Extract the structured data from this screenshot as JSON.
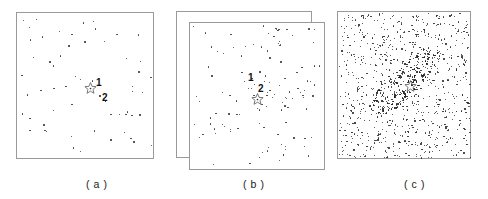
{
  "figure": {
    "background_color": "#ffffff",
    "border_color": "#9a9a9a",
    "dot_color": "#3a3a3a",
    "label_color": "#111111",
    "width": 488,
    "height": 199
  },
  "panels": [
    {
      "id": "a",
      "caption": "( a )",
      "caption_x": 86,
      "caption_y": 178,
      "boxes": [
        {
          "role": "single",
          "x": 16,
          "y": 12,
          "w": 138,
          "h": 147
        }
      ],
      "star": {
        "x": 84,
        "y": 82,
        "size": 13,
        "has_center_dot": true
      },
      "markers": [
        {
          "label": "1",
          "label_x": 96,
          "label_y": 78,
          "dot_x": null,
          "dot_y": null
        },
        {
          "label": "2",
          "label_x": 102,
          "label_y": 93,
          "dot_x": 99,
          "dot_y": 95
        }
      ]
    },
    {
      "id": "b",
      "caption": "( b )",
      "caption_x": 243,
      "caption_y": 178,
      "boxes": [
        {
          "role": "back",
          "x": 176,
          "y": 11,
          "w": 136,
          "h": 147
        },
        {
          "role": "front",
          "x": 189,
          "y": 22,
          "w": 136,
          "h": 148
        }
      ],
      "star": {
        "x": 251,
        "y": 93,
        "size": 13,
        "has_center_dot": true
      },
      "markers": [
        {
          "label": "1",
          "label_x": 248,
          "label_y": 73,
          "dot_x": 259,
          "dot_y": 71
        },
        {
          "label": "2",
          "label_x": 258,
          "label_y": 84,
          "dot_x": null,
          "dot_y": null
        }
      ]
    },
    {
      "id": "c",
      "caption": "( c )",
      "caption_x": 404,
      "caption_y": 178,
      "boxes": [
        {
          "role": "single",
          "x": 337,
          "y": 11,
          "w": 134,
          "h": 148
        }
      ],
      "star": {
        "x": 404,
        "y": 80,
        "size": 13,
        "has_center_dot": false
      },
      "markers": []
    }
  ],
  "chart_data": {
    "type": "scatter",
    "title": "",
    "xlabel": "",
    "ylabel": "",
    "grid": false,
    "legend": null,
    "panel_count": 3,
    "panels": [
      {
        "id": "a",
        "caption": "( a )",
        "description": "Sparse uniform random scatter inside a single square frame with a star marker near the centre labelled 1 and a nearby point labelled 2.",
        "frame_count": 1,
        "point_count": 58,
        "distribution": "uniform-random",
        "annotations": [
          {
            "text": "1",
            "refers_to": "star-marker"
          },
          {
            "text": "2",
            "refers_to": "point-marker"
          }
        ]
      },
      {
        "id": "b",
        "caption": "( b )",
        "description": "Two overlapping offset square frames containing a denser uniform scatter with a mild central concentration; point labelled 1 and star marker labelled 2 near the centre.",
        "frame_count": 2,
        "point_count": 118,
        "distribution": "uniform-random-with-mild-central-concentration",
        "annotations": [
          {
            "text": "1",
            "refers_to": "point-marker"
          },
          {
            "text": "2",
            "refers_to": "star-marker"
          }
        ]
      },
      {
        "id": "c",
        "caption": "( c )",
        "description": "Very dense uniform background scatter inside a single square frame overlaid by an elongated diagonal elliptical over-density running from lower-left to upper-right, with an unlabelled star marker at its centre inside a central void.",
        "frame_count": 1,
        "point_count": 980,
        "background_point_count": 760,
        "cluster_point_count": 220,
        "distribution": "uniform-background-plus-elongated-elliptical-cluster",
        "cluster": {
          "shape": "elongated-ellipse-ring",
          "position_angle_deg": 45,
          "semi_major_px": 46,
          "semi_minor_px": 14,
          "central_void": true
        },
        "annotations": []
      }
    ]
  }
}
